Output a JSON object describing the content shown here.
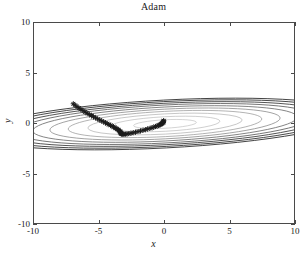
{
  "figure": {
    "title": "Adam",
    "background": "#ffffff",
    "axis_color": "#4a4a4a"
  },
  "axes": {
    "xlabel": "x",
    "ylabel": "y",
    "xticklabels": [
      "-10",
      "-5",
      "0",
      "5",
      "10"
    ],
    "yticklabels": [
      "10",
      "5",
      "0",
      "-5",
      "-10"
    ]
  },
  "chart_data": {
    "type": "line",
    "title": "Adam",
    "xlabel": "x",
    "ylabel": "y",
    "xlim": [
      -10,
      10
    ],
    "ylim": [
      -10,
      10
    ],
    "xticks": [
      -10,
      -5,
      0,
      5,
      10
    ],
    "yticks": [
      -10,
      -5,
      0,
      5,
      10
    ],
    "grid": false,
    "legend": "none",
    "contours": {
      "type": "ellipse-levels",
      "center": [
        0,
        0
      ],
      "rotation_deg": -3,
      "note": "Nested axis-aligned-ish ellipses, very wide and flat; outer levels drawn darker.",
      "levels": [
        {
          "rx": 2.4,
          "ry": 0.42,
          "color": "#b9b9b9",
          "width": 0.6
        },
        {
          "rx": 4.2,
          "ry": 0.72,
          "color": "#b0b0b0",
          "width": 0.6
        },
        {
          "rx": 5.9,
          "ry": 1.0,
          "color": "#a3a3a3",
          "width": 0.6
        },
        {
          "rx": 7.4,
          "ry": 1.25,
          "color": "#949494",
          "width": 0.7
        },
        {
          "rx": 8.8,
          "ry": 1.47,
          "color": "#7e7e7e",
          "width": 0.7
        },
        {
          "rx": 10.1,
          "ry": 1.68,
          "color": "#6a6a6a",
          "width": 0.8
        },
        {
          "rx": 11.3,
          "ry": 1.88,
          "color": "#565656",
          "width": 0.8
        },
        {
          "rx": 12.4,
          "ry": 2.05,
          "color": "#454545",
          "width": 0.9
        },
        {
          "rx": 13.4,
          "ry": 2.22,
          "color": "#3a3a3a",
          "width": 0.9
        },
        {
          "rx": 14.3,
          "ry": 2.37,
          "color": "#333333",
          "width": 0.9
        }
      ]
    },
    "trajectory": {
      "name": "Adam path",
      "marker": "asterisk",
      "marker_color": "#1c1c1c",
      "marker_size": 2.2,
      "start": [
        -7.0,
        2.0
      ],
      "end": [
        -0.1,
        0.35
      ],
      "x": [
        -7.0,
        -6.86,
        -6.72,
        -6.57,
        -6.42,
        -6.26,
        -6.1,
        -5.94,
        -5.78,
        -5.62,
        -5.46,
        -5.3,
        -5.14,
        -4.98,
        -4.83,
        -4.68,
        -4.54,
        -4.41,
        -4.28,
        -4.16,
        -4.04,
        -3.93,
        -3.83,
        -3.74,
        -3.66,
        -3.59,
        -3.53,
        -3.48,
        -3.44,
        -3.41,
        -3.39,
        -3.37,
        -3.36,
        -3.35,
        -3.33,
        -3.3,
        -3.26,
        -3.2,
        -3.12,
        -3.02,
        -2.9,
        -2.76,
        -2.6,
        -2.43,
        -2.25,
        -2.06,
        -1.87,
        -1.68,
        -1.5,
        -1.32,
        -1.15,
        -0.99,
        -0.85,
        -0.72,
        -0.61,
        -0.51,
        -0.43,
        -0.36,
        -0.3,
        -0.25,
        -0.21,
        -0.18,
        -0.15,
        -0.13,
        -0.12,
        -0.11,
        -0.1
      ],
      "y": [
        2.0,
        1.86,
        1.72,
        1.58,
        1.45,
        1.32,
        1.19,
        1.07,
        0.95,
        0.83,
        0.72,
        0.61,
        0.5,
        0.4,
        0.3,
        0.21,
        0.12,
        0.03,
        -0.05,
        -0.13,
        -0.21,
        -0.29,
        -0.36,
        -0.43,
        -0.5,
        -0.56,
        -0.62,
        -0.68,
        -0.73,
        -0.78,
        -0.83,
        -0.87,
        -0.91,
        -0.94,
        -0.97,
        -0.99,
        -1.0,
        -1.01,
        -1.01,
        -1.0,
        -0.98,
        -0.95,
        -0.91,
        -0.86,
        -0.81,
        -0.75,
        -0.69,
        -0.62,
        -0.56,
        -0.49,
        -0.43,
        -0.37,
        -0.31,
        -0.25,
        -0.2,
        -0.15,
        -0.1,
        -0.05,
        -0.01,
        0.03,
        0.07,
        0.11,
        0.15,
        0.19,
        0.23,
        0.28,
        0.33
      ]
    }
  }
}
